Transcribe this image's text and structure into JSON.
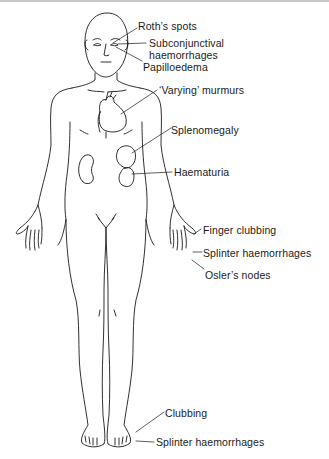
{
  "diagram": {
    "labels": {
      "roths_spots": "Roth’s spots",
      "subconjunctival_1": "Subconjunctival",
      "subconjunctival_2": "haemorrhages",
      "papilloedema": "Papilloedema",
      "murmurs": "‘Varying’ murmurs",
      "splenomegaly": "Splenomegaly",
      "haematuria": "Haematuria",
      "finger_clubbing": "Finger clubbing",
      "splinter_hand": "Splinter haemorrhages",
      "oslers_nodes": "Osler’s nodes",
      "clubbing_foot": "Clubbing",
      "splinter_foot": "Splinter haemorrhages"
    },
    "colors": {
      "line": "#1a1a1a",
      "background": "#ffffff"
    }
  }
}
